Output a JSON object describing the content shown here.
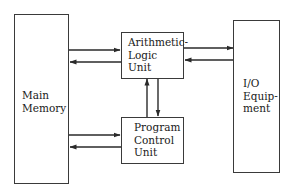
{
  "diagram": {
    "type": "block-diagram",
    "colors": {
      "stroke": "#3a3a3a",
      "text": "#1a1a1a",
      "background": "#ffffff"
    },
    "nodes": {
      "main_memory": {
        "lines": [
          "Main",
          "Memory"
        ]
      },
      "alu": {
        "lines": [
          "Arithmetic-",
          "Logic",
          "Unit"
        ]
      },
      "pcu": {
        "lines": [
          "Program",
          "Control",
          "Unit"
        ]
      },
      "io": {
        "lines": [
          "I/O",
          "Equip-",
          "ment"
        ]
      }
    },
    "edges": [
      {
        "from": "Main Memory",
        "to": "Arithmetic-Logic Unit"
      },
      {
        "from": "Arithmetic-Logic Unit",
        "to": "Main Memory"
      },
      {
        "from": "Main Memory",
        "to": "Program Control Unit"
      },
      {
        "from": "Program Control Unit",
        "to": "Main Memory"
      },
      {
        "from": "Arithmetic-Logic Unit",
        "to": "I/O Equipment"
      },
      {
        "from": "I/O Equipment",
        "to": "Arithmetic-Logic Unit"
      },
      {
        "from": "Program Control Unit",
        "to": "Arithmetic-Logic Unit"
      },
      {
        "from": "Arithmetic-Logic Unit",
        "to": "Program Control Unit"
      }
    ]
  }
}
